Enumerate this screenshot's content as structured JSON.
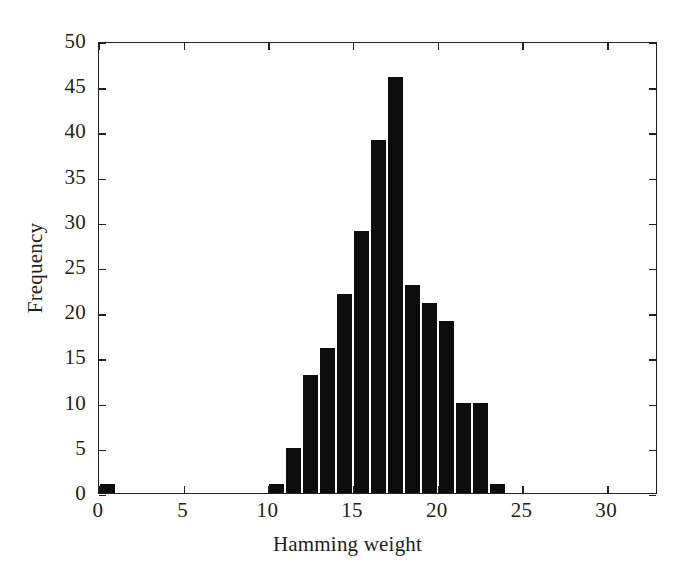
{
  "chart_data": {
    "type": "bar",
    "title": "",
    "xlabel": "Hamming weight",
    "ylabel": "Frequency",
    "xlim": [
      0,
      33
    ],
    "ylim": [
      0,
      50
    ],
    "grid": false,
    "legend": null,
    "bar_color": "#0d0d0d",
    "axis_color": "#231f20",
    "background": "#ffffff",
    "bin_width": 1,
    "xticks": [
      0,
      5,
      10,
      15,
      20,
      25,
      30
    ],
    "xticklabels": [
      "0",
      "5",
      "10",
      "15",
      "20",
      "25",
      "30"
    ],
    "yticks": [
      0,
      5,
      10,
      15,
      20,
      25,
      30,
      35,
      40,
      45,
      50
    ],
    "yticklabels": [
      "0",
      "5",
      "10",
      "15",
      "20",
      "25",
      "30",
      "35",
      "40",
      "45",
      "50"
    ],
    "categories": [
      0,
      10,
      11,
      12,
      13,
      14,
      15,
      16,
      17,
      18,
      19,
      20,
      21,
      22,
      23
    ],
    "values": [
      1,
      1,
      5,
      13,
      16,
      22,
      29,
      39,
      46,
      23,
      21,
      19,
      10,
      10,
      1
    ],
    "bars": [
      {
        "x": 0,
        "value": 1
      },
      {
        "x": 10,
        "value": 1
      },
      {
        "x": 11,
        "value": 5
      },
      {
        "x": 12,
        "value": 13
      },
      {
        "x": 13,
        "value": 16
      },
      {
        "x": 14,
        "value": 22
      },
      {
        "x": 15,
        "value": 29
      },
      {
        "x": 16,
        "value": 39
      },
      {
        "x": 17,
        "value": 46
      },
      {
        "x": 18,
        "value": 23
      },
      {
        "x": 19,
        "value": 21
      },
      {
        "x": 20,
        "value": 19
      },
      {
        "x": 21,
        "value": 10
      },
      {
        "x": 22,
        "value": 10
      },
      {
        "x": 23,
        "value": 1
      }
    ]
  }
}
